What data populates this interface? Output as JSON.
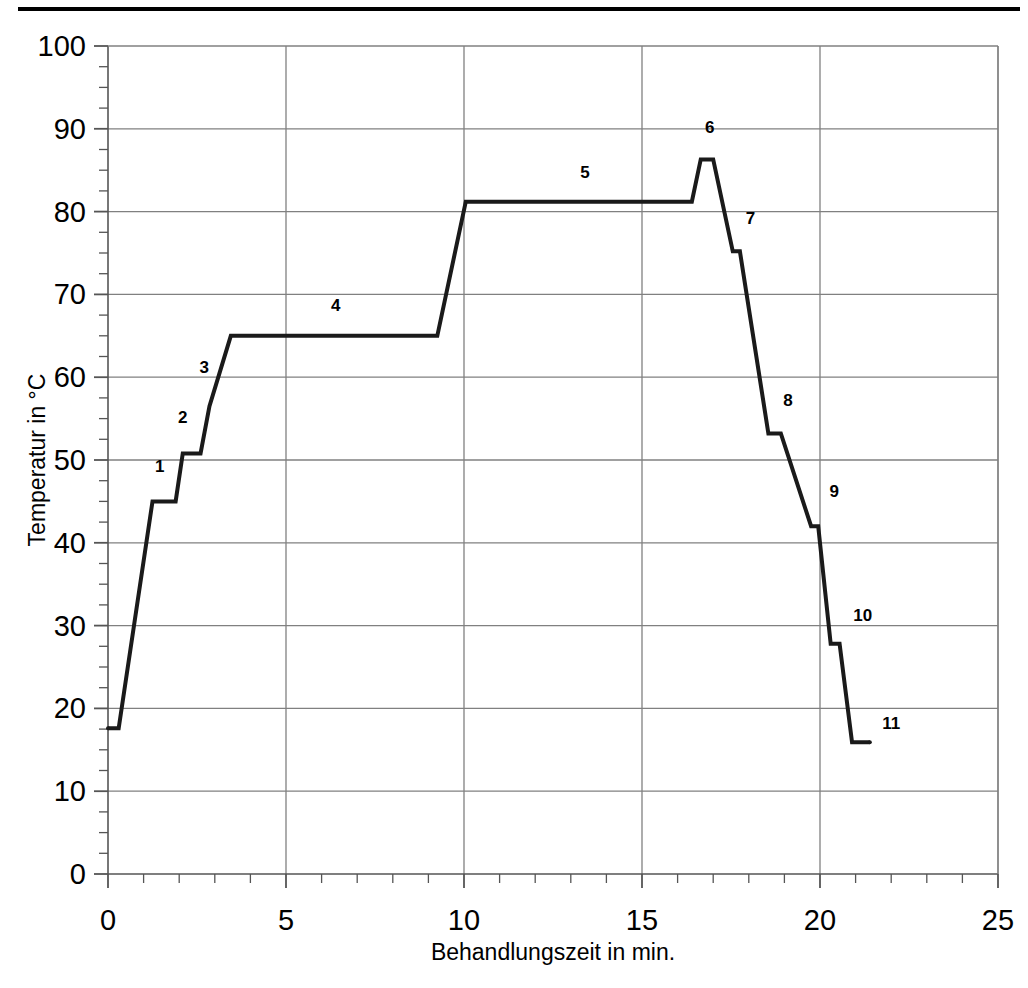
{
  "figure": {
    "top_rule": "horizontal-rule",
    "background_color": "#ffffff",
    "line_color": "#1a1a1a",
    "grid_color": "#808080",
    "axis_color": "#555555"
  },
  "chart_data": {
    "type": "line",
    "title": "",
    "subtitle": "",
    "xlabel": "Behandlungszeit in min.",
    "ylabel": "Temperatur in °C",
    "xlim": [
      0,
      25
    ],
    "ylim": [
      0,
      100
    ],
    "xticks": [
      0,
      5,
      10,
      15,
      20,
      25
    ],
    "xtick_labels": [
      "0",
      "5",
      "10",
      "15",
      "20",
      "25"
    ],
    "yticks": [
      0,
      10,
      20,
      30,
      40,
      50,
      60,
      70,
      80,
      90,
      100
    ],
    "ytick_labels": [
      "0",
      "10",
      "20",
      "30",
      "40",
      "50",
      "60",
      "70",
      "80",
      "90",
      "100"
    ],
    "x_minor_tick_step": 1,
    "y_minor_tick_step": 2.5,
    "grid": true,
    "grid_axis": "both",
    "legend": false,
    "legend_position": "none",
    "series": [
      {
        "name": "Temperaturverlauf",
        "color": "#1a1a1a",
        "line_width": 4,
        "x": [
          0.0,
          0.3,
          1.25,
          1.9,
          2.1,
          2.6,
          2.85,
          3.45,
          9.25,
          10.05,
          16.4,
          16.65,
          17.0,
          17.55,
          17.75,
          18.55,
          18.9,
          19.75,
          19.95,
          20.3,
          20.55,
          20.9,
          21.4
        ],
        "y": [
          17.6,
          17.6,
          45.0,
          45.0,
          50.8,
          50.8,
          56.5,
          65.0,
          65.0,
          81.2,
          81.2,
          86.3,
          86.3,
          75.2,
          75.2,
          53.2,
          53.2,
          42.0,
          42.0,
          27.8,
          27.8,
          15.9,
          15.9
        ]
      }
    ],
    "point_labels": [
      {
        "text": "1",
        "x": 1.45,
        "y": 48.5
      },
      {
        "text": "2",
        "x": 2.1,
        "y": 54.5
      },
      {
        "text": "3",
        "x": 2.7,
        "y": 60.5
      },
      {
        "text": "4",
        "x": 6.4,
        "y": 68.0
      },
      {
        "text": "5",
        "x": 13.4,
        "y": 84.0
      },
      {
        "text": "6",
        "x": 16.9,
        "y": 89.5
      },
      {
        "text": "7",
        "x": 18.05,
        "y": 78.5
      },
      {
        "text": "8",
        "x": 19.1,
        "y": 56.5
      },
      {
        "text": "9",
        "x": 20.4,
        "y": 45.5
      },
      {
        "text": "10",
        "x": 21.2,
        "y": 30.5
      },
      {
        "text": "11",
        "x": 22.0,
        "y": 17.5
      }
    ],
    "annotations_note": "Numbered step plateaus 1-11 of the temperature treatment curve"
  }
}
